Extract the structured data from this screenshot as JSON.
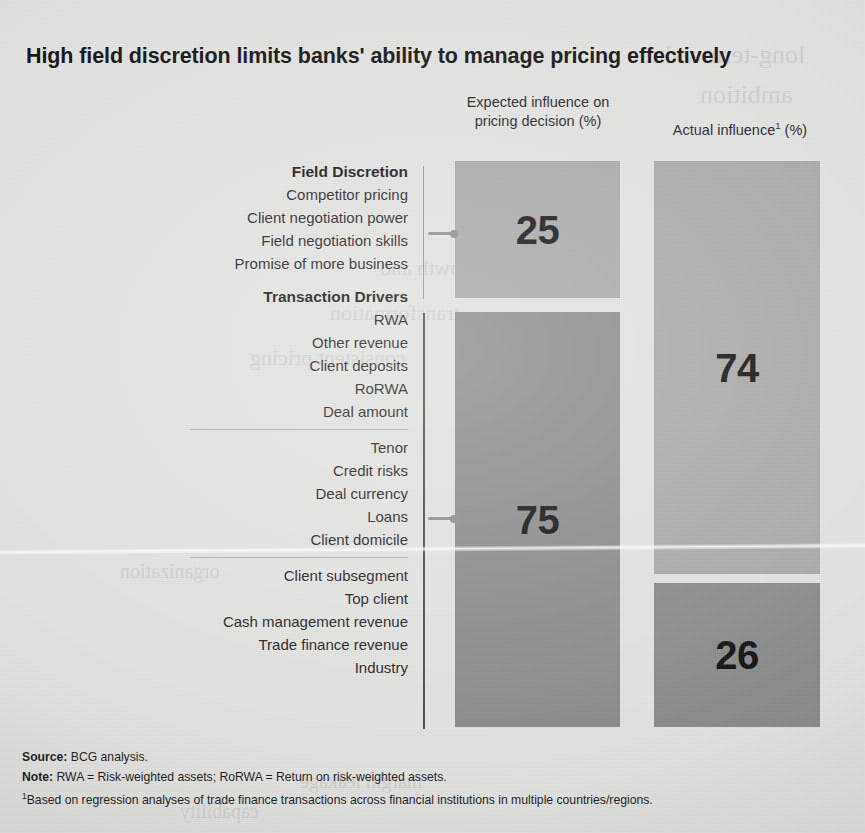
{
  "title": "High field discretion limits banks' ability to manage pricing effectively",
  "columns": {
    "expected": "Expected influence on\npricing decision (%)",
    "expected_line1": "Expected influence on",
    "expected_line2": "pricing decision (%)",
    "actual_pre": "Actual influence",
    "actual_sup": "1",
    "actual_post": " (%)"
  },
  "groups": [
    {
      "title": "Field Discretion",
      "items": [
        "Competitor pricing",
        "Client negotiation power",
        "Field negotiation skills",
        "Promise of more business"
      ]
    },
    {
      "title": "Transaction Drivers",
      "subgroups": [
        {
          "items": [
            "RWA",
            "Other revenue",
            "Client deposits",
            "RoRWA",
            "Deal amount"
          ]
        },
        {
          "items": [
            "Tenor",
            "Credit risks",
            "Deal currency",
            "Loans",
            "Client domicile"
          ]
        },
        {
          "items": [
            "Client subsegment",
            "Top client",
            "Cash management revenue",
            "Trade finance revenue",
            "Industry"
          ]
        }
      ]
    }
  ],
  "notes": {
    "source_label": "Source:",
    "source_text": " BCG analysis.",
    "note_label": "Note:",
    "note_text": " RWA = Risk-weighted assets; RoRWA = Return on risk-weighted assets.",
    "footnote_marker": "1",
    "footnote_text": "Based on regression analyses of trade finance transactions across financial institutions in multiple countries/regions."
  },
  "colors": {
    "background": "#e3e3e2",
    "bar_light": "#a9a9a9",
    "bar_dark": "#8a8a8a",
    "text": "#1b1b1b",
    "connector": "#8e8e8e"
  },
  "chart_data": {
    "type": "bar",
    "title": "High field discretion limits banks' ability to manage pricing effectively",
    "xlabel": "",
    "ylabel": "",
    "ylim": [
      0,
      100
    ],
    "categories": [
      "Field Discretion",
      "Transaction Drivers"
    ],
    "series": [
      {
        "name": "Expected influence on pricing decision (%)",
        "values": [
          25,
          75
        ]
      },
      {
        "name": "Actual influence (%)",
        "values": [
          74,
          26
        ]
      }
    ],
    "segments": [
      {
        "column": "Expected influence on pricing decision (%)",
        "category": "Field Discretion",
        "value": 25,
        "label": "25",
        "color": "#a9a9a9"
      },
      {
        "column": "Expected influence on pricing decision (%)",
        "category": "Transaction Drivers",
        "value": 75,
        "label": "75",
        "color": "#8a8a8a"
      },
      {
        "column": "Actual influence (%)",
        "category": "Field Discretion",
        "value": 74,
        "label": "74",
        "color": "#a9a9a9"
      },
      {
        "column": "Actual influence (%)",
        "category": "Transaction Drivers",
        "value": 26,
        "label": "26",
        "color": "#8a8a8a"
      }
    ],
    "bar_labels": {
      "expected_fd": "25",
      "expected_td": "75",
      "actual_fd": "74",
      "actual_td": "26"
    },
    "legend_position": "top",
    "grid": false,
    "annotations": [
      "Field Discretion drivers: Competitor pricing; Client negotiation power; Field negotiation skills; Promise of more business",
      "Transaction Drivers: RWA; Other revenue; Client deposits; RoRWA; Deal amount; Tenor; Credit risks; Deal currency; Loans; Client domicile; Client subsegment; Top client; Cash management revenue; Trade finance revenue; Industry"
    ]
  },
  "bleed": [
    {
      "t": "long-term value",
      "x": 640,
      "y": 40,
      "s": 26
    },
    {
      "t": "ambition",
      "x": 700,
      "y": 80,
      "s": 26
    },
    {
      "t": "sustainable growth and",
      "x": 380,
      "y": 255,
      "s": 22
    },
    {
      "t": "transformation",
      "x": 330,
      "y": 300,
      "s": 22
    },
    {
      "t": "consistent pricing",
      "x": 250,
      "y": 345,
      "s": 22
    },
    {
      "t": "organization",
      "x": 120,
      "y": 560,
      "s": 20
    },
    {
      "t": "margin leakage",
      "x": 300,
      "y": 770,
      "s": 20
    },
    {
      "t": "capability",
      "x": 180,
      "y": 800,
      "s": 20
    }
  ]
}
